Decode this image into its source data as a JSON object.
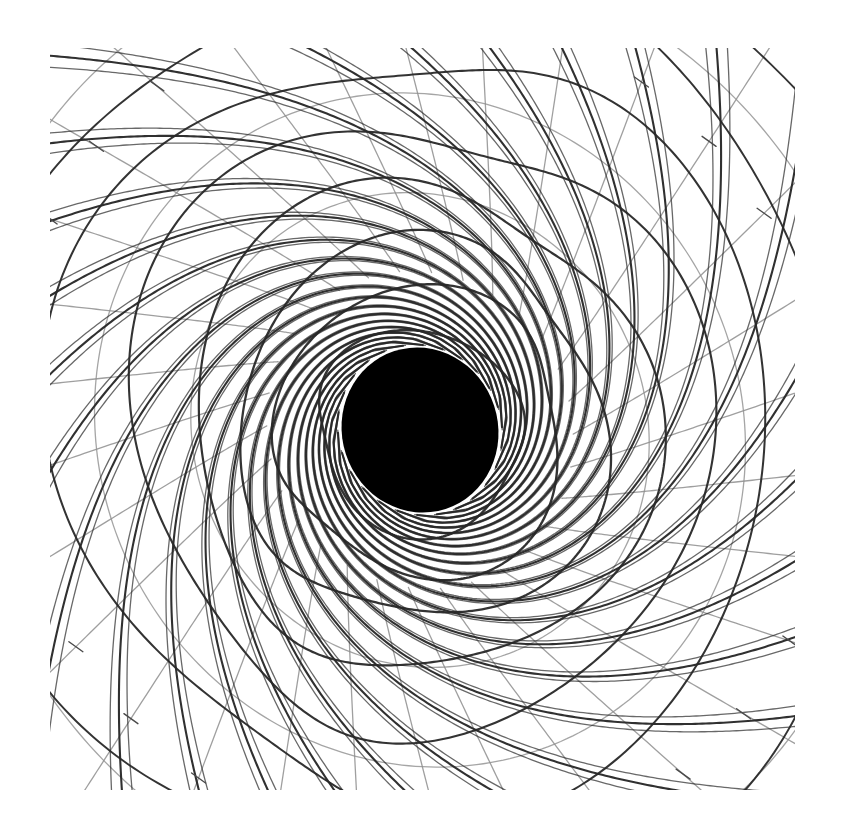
{
  "figure": {
    "background_color": "#ffffff",
    "width": 844,
    "height": 835
  },
  "plot_area": {
    "x": 50,
    "y": 48,
    "width": 745,
    "height": 742
  },
  "shadow": {
    "label": "black-hole-shadow",
    "center_x": 420,
    "center_y": 430,
    "radius_x": 78,
    "radius_y": 83,
    "rotation_deg": -18,
    "color": "#000000"
  },
  "colors": {
    "background": "#ffffff",
    "ray_dark": "#282828",
    "grid_light": "#8e8e8e",
    "shadow": "#000000"
  },
  "chart_data": {
    "type": "line",
    "xlabel": "",
    "ylabel": "",
    "xlim": [
      -1.0,
      1.0
    ],
    "ylim": [
      -1.0,
      1.0
    ],
    "grid": false,
    "legend": "none",
    "annotations": [
      "central black shadow disk (event horizon)",
      "caustic ray bundles converging near photon sphere",
      "warped polar grid: spiral radial spokes and distorted rings"
    ],
    "series": [
      {
        "name": "spiral-rays-dark",
        "style": "dark",
        "color": "#282828",
        "line_width": 2.1,
        "count": 26,
        "winding_turns": 1.35,
        "description": "Heavy dark spiral trajectories wrapping clockwise around the shadow"
      },
      {
        "name": "ring-arcs-dark",
        "style": "dark",
        "color": "#282828",
        "line_width": 1.9,
        "count": 13,
        "description": "Dark distorted concentric rings lensed around the shadow"
      },
      {
        "name": "background-grid-light",
        "style": "light",
        "color": "#8e8e8e",
        "line_width": 1.3,
        "count": 30,
        "description": "Lighter grey undistorted background grid lines"
      }
    ],
    "spiral_params": {
      "inner_radius": 0.085,
      "outer_radius": 1.45,
      "twist": 2.55,
      "shear_x": 0.04,
      "shear_y": -0.02
    }
  }
}
